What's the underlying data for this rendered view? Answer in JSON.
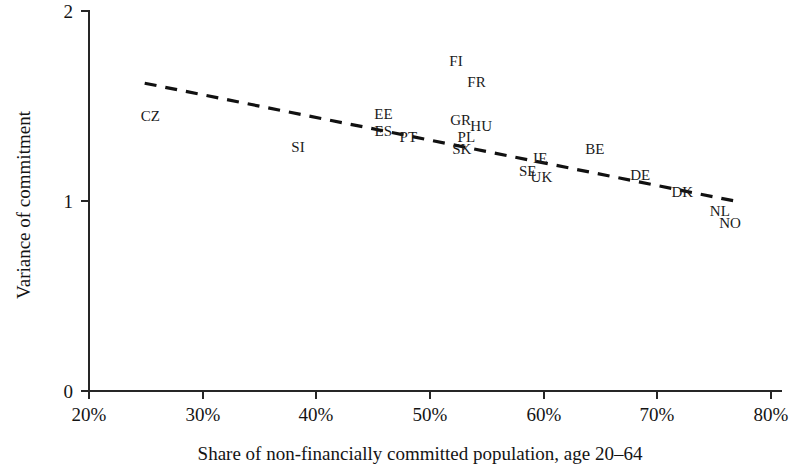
{
  "chart_data": {
    "type": "scatter",
    "title": "",
    "subtitle": "",
    "xlabel": "Share of non-financially committed population, age 20–64",
    "ylabel": "Variance of commitment",
    "xlim": [
      20,
      80
    ],
    "ylim": [
      0,
      2
    ],
    "xticks": [
      20,
      30,
      40,
      50,
      60,
      70,
      80
    ],
    "xtick_labels": [
      "20%",
      "30%",
      "40%",
      "50%",
      "60%",
      "70%",
      "80%"
    ],
    "yticks": [
      0,
      1,
      2
    ],
    "ytick_labels": [
      "0",
      "1",
      "2"
    ],
    "grid": false,
    "legend": "none",
    "marker_style": "text-label-only",
    "points": [
      {
        "label": "CZ",
        "x": 25.4,
        "y": 1.42
      },
      {
        "label": "SI",
        "x": 38.4,
        "y": 1.26
      },
      {
        "label": "EE",
        "x": 45.9,
        "y": 1.43
      },
      {
        "label": "ES",
        "x": 45.9,
        "y": 1.34
      },
      {
        "label": "PT",
        "x": 48.1,
        "y": 1.31
      },
      {
        "label": "FI",
        "x": 52.3,
        "y": 1.71
      },
      {
        "label": "SK",
        "x": 52.8,
        "y": 1.25
      },
      {
        "label": "GR",
        "x": 52.7,
        "y": 1.4
      },
      {
        "label": "PL",
        "x": 53.2,
        "y": 1.31
      },
      {
        "label": "FR",
        "x": 54.1,
        "y": 1.6
      },
      {
        "label": "HU",
        "x": 54.5,
        "y": 1.37
      },
      {
        "label": "SE",
        "x": 58.6,
        "y": 1.13
      },
      {
        "label": "IE",
        "x": 59.7,
        "y": 1.2
      },
      {
        "label": "UK",
        "x": 59.8,
        "y": 1.1
      },
      {
        "label": "BE",
        "x": 64.5,
        "y": 1.25
      },
      {
        "label": "DE",
        "x": 68.5,
        "y": 1.11
      },
      {
        "label": "DK",
        "x": 72.2,
        "y": 1.02
      },
      {
        "label": "NL",
        "x": 75.5,
        "y": 0.92
      },
      {
        "label": "NO",
        "x": 76.4,
        "y": 0.86
      }
    ],
    "trend_line": {
      "style": "dashed",
      "x_start": 24.9,
      "y_start": 1.62,
      "x_end": 76.8,
      "y_end": 1.0
    }
  }
}
